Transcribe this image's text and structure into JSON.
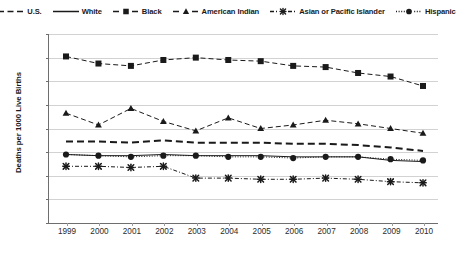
{
  "chart_data": {
    "type": "line",
    "title": "",
    "xlabel": "",
    "ylabel": "Deaths per 1000 Live Births",
    "x": [
      1999,
      2000,
      2001,
      2002,
      2003,
      2004,
      2005,
      2006,
      2007,
      2008,
      2009,
      2010
    ],
    "categories": [
      "1999",
      "2000",
      "2001",
      "2002",
      "2003",
      "2004",
      "2005",
      "2006",
      "2007",
      "2008",
      "2009",
      "2010"
    ],
    "ylim": [
      0,
      16
    ],
    "yticks": [
      0,
      2,
      4,
      6,
      8,
      10,
      12,
      14,
      16
    ],
    "ytick_labels": [
      "0",
      "2",
      "4",
      "6",
      "8",
      "10",
      "12",
      "14",
      "16"
    ],
    "grid": true,
    "legend_position": "top",
    "series": [
      {
        "name": "U.S.",
        "marker": "none",
        "line_style": "dashed",
        "color": "#1a1a1a",
        "values": [
          6.9,
          6.9,
          6.8,
          7.0,
          6.8,
          6.8,
          6.8,
          6.7,
          6.7,
          6.6,
          6.4,
          6.1
        ]
      },
      {
        "name": "White",
        "marker": "none",
        "line_style": "solid",
        "color": "#1a1a1a",
        "values": [
          5.8,
          5.7,
          5.7,
          5.8,
          5.7,
          5.7,
          5.7,
          5.6,
          5.6,
          5.6,
          5.3,
          5.2
        ]
      },
      {
        "name": "Black",
        "marker": "square",
        "line_style": "dashed",
        "color": "#1a1a1a",
        "values": [
          14.1,
          13.5,
          13.3,
          13.8,
          14.0,
          13.8,
          13.7,
          13.3,
          13.2,
          12.7,
          12.4,
          11.6
        ]
      },
      {
        "name": "American Indian",
        "marker": "triangle",
        "line_style": "dashed",
        "color": "#1a1a1a",
        "values": [
          9.3,
          8.3,
          9.7,
          8.6,
          7.8,
          8.9,
          8.0,
          8.3,
          8.7,
          8.4,
          8.0,
          7.6
        ]
      },
      {
        "name": "Asian or Pacific Islander",
        "marker": "x",
        "line_style": "dash-dot",
        "color": "#1a1a1a",
        "values": [
          4.8,
          4.8,
          4.7,
          4.8,
          3.8,
          3.8,
          3.7,
          3.7,
          3.8,
          3.7,
          3.5,
          3.4
        ]
      },
      {
        "name": "Hispanic",
        "marker": "circle",
        "line_style": "dotted",
        "color": "#1a1a1a",
        "values": [
          5.8,
          5.7,
          5.6,
          5.7,
          5.7,
          5.6,
          5.6,
          5.5,
          5.6,
          5.6,
          5.4,
          5.3
        ]
      }
    ]
  },
  "legend": {
    "items": [
      {
        "label": "U.S.",
        "icon": "dashed-line-swatch"
      },
      {
        "label": "White",
        "icon": "solid-line-swatch"
      },
      {
        "label": "Black",
        "icon": "dashed-square-swatch"
      },
      {
        "label": "American Indian",
        "icon": "dashed-triangle-swatch"
      },
      {
        "label": "Asian or Pacific Islander",
        "icon": "dashdot-x-swatch"
      },
      {
        "label": "Hispanic",
        "icon": "dotted-circle-swatch"
      }
    ]
  },
  "axes": {
    "y_title": "Deaths per 1000 Live Births"
  },
  "colors": {
    "ink": "#1a1a1a",
    "grid": "#d2d2d2",
    "axis": "#6e6e6e",
    "background": "#ffffff"
  }
}
